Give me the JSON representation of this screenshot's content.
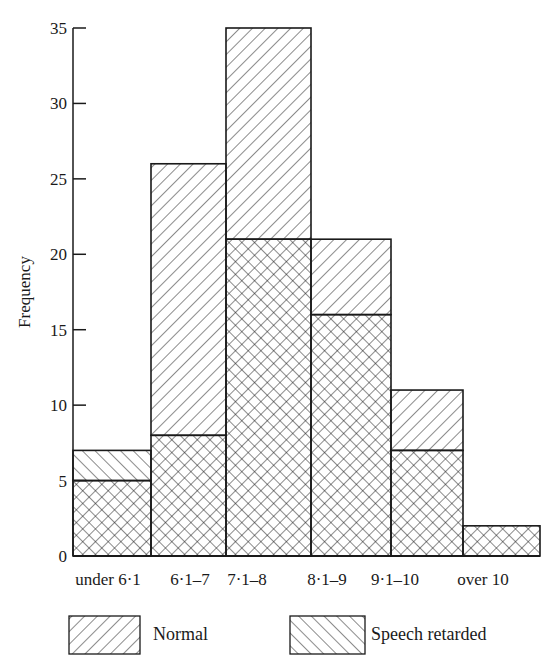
{
  "chart_data": {
    "type": "bar",
    "subtype": "overlaid-histogram",
    "title": "",
    "xlabel": "",
    "ylabel": "Frequency",
    "ylim": [
      0,
      35
    ],
    "yticks": [
      0,
      5,
      10,
      15,
      20,
      25,
      30,
      35
    ],
    "grid": false,
    "legend_position": "bottom",
    "categories": [
      "under 6·1",
      "6·1–7",
      "7·1–8",
      "8·1–9",
      "9·1–10",
      "over 10"
    ],
    "series": [
      {
        "name": "Normal",
        "pattern": "backslash-hatch",
        "values": [
          5,
          26,
          35,
          21,
          11,
          2
        ]
      },
      {
        "name": "Speech retarded",
        "pattern": "slash-hatch",
        "values": [
          7,
          8,
          21,
          16,
          7,
          2
        ]
      }
    ],
    "overlap_pattern": "cross-hatch"
  },
  "axis": {
    "ylabel": "Frequency",
    "yticks": [
      "0",
      "5",
      "10",
      "15",
      "20",
      "25",
      "30",
      "35"
    ]
  },
  "legend": {
    "normal": "Normal",
    "speech": "Speech retarded"
  },
  "colors": {
    "ink": "#1a1a1a",
    "background": "#ffffff"
  }
}
